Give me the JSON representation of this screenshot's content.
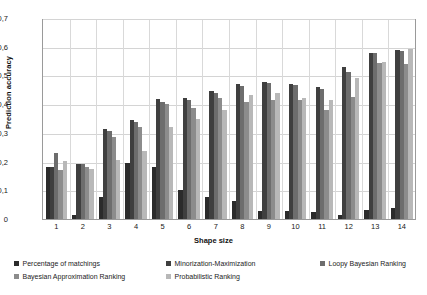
{
  "chart_data": {
    "type": "bar",
    "title": "",
    "xlabel": "Shape size",
    "ylabel": "Prediction accuracy",
    "ylim": [
      0,
      0.7
    ],
    "ytick_labels": [
      "0,7",
      "0,6",
      "0,5",
      "0,4",
      "0,3",
      "0,2",
      "0,1",
      "0"
    ],
    "ytick_values": [
      0.7,
      0.6,
      0.5,
      0.4,
      0.3,
      0.2,
      0.1,
      0
    ],
    "grid": true,
    "legend_position": "bottom",
    "categories": [
      "1",
      "2",
      "3",
      "4",
      "5",
      "6",
      "7",
      "8",
      "9",
      "10",
      "11",
      "12",
      "13",
      "14"
    ],
    "series": [
      {
        "name": "Percentage of matchings",
        "color": "#2b2b2b",
        "values": [
          0.183,
          0.013,
          0.078,
          0.198,
          0.183,
          0.102,
          0.078,
          0.063,
          0.029,
          0.027,
          0.024,
          0.013,
          0.032,
          0.037
        ]
      },
      {
        "name": "Minorization-Maximization",
        "color": "#3f3f3f",
        "values": [
          0.183,
          0.193,
          0.316,
          0.347,
          0.422,
          0.427,
          0.452,
          0.474,
          0.481,
          0.476,
          0.466,
          0.534,
          0.585,
          0.596
        ]
      },
      {
        "name": "Loopy Bayesian Ranking",
        "color": "#6d6d6d",
        "values": [
          0.232,
          0.192,
          0.308,
          0.34,
          0.41,
          0.417,
          0.443,
          0.468,
          0.479,
          0.47,
          0.456,
          0.517,
          0.583,
          0.591
        ]
      },
      {
        "name": "Bayesian Approximation Ranking",
        "color": "#8c8c8c",
        "values": [
          0.174,
          0.183,
          0.29,
          0.325,
          0.405,
          0.391,
          0.424,
          0.412,
          0.419,
          0.417,
          0.384,
          0.43,
          0.548,
          0.545
        ]
      },
      {
        "name": "Probabilistic Ranking",
        "color": "#b8b8b8",
        "values": [
          0.205,
          0.176,
          0.207,
          0.239,
          0.325,
          0.351,
          0.382,
          0.437,
          0.442,
          0.426,
          0.418,
          0.497,
          0.551,
          0.598
        ]
      }
    ]
  },
  "axes": {
    "y_title": "Prediction accuracy",
    "x_title": "Shape size"
  }
}
